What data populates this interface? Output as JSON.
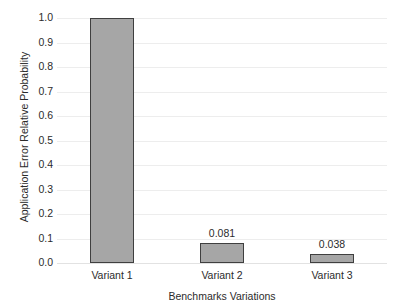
{
  "chart_data": {
    "type": "bar",
    "title": "",
    "xlabel": "Benchmarks Variations",
    "ylabel": "Application Error Relative Probability",
    "categories": [
      "Variant 1",
      "Variant 2",
      "Variant 3"
    ],
    "values": [
      1.0,
      0.081,
      0.038
    ],
    "data_labels": [
      "",
      "0.081",
      "0.038"
    ],
    "ylim": [
      0.0,
      1.0
    ],
    "ytick_labels": [
      "0.0",
      "0.1",
      "0.2",
      "0.3",
      "0.4",
      "0.5",
      "0.6",
      "0.7",
      "0.8",
      "0.9",
      "1.0"
    ],
    "ytick_values": [
      0.0,
      0.1,
      0.2,
      0.3,
      0.4,
      0.5,
      0.6,
      0.7,
      0.8,
      0.9,
      1.0
    ],
    "grid": true,
    "grid_axis": "y",
    "legend": false,
    "legend_position": "none",
    "colors": {
      "bar_fill": "#a6a6a6",
      "bar_border": "#3f3f3f",
      "gridline": "#ededed",
      "baseline": "#e2e2e2",
      "text": "#2b2b2b",
      "background": "#ffffff"
    }
  }
}
